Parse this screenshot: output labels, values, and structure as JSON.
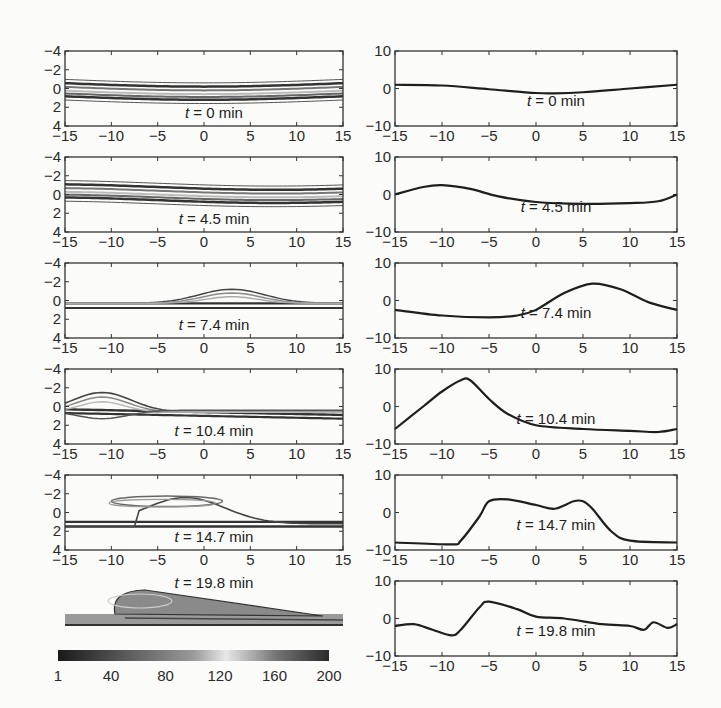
{
  "chart_data": [
    {
      "type": "heatmap",
      "column": "left",
      "description": "Contour plots of concentration field at successive times",
      "x_ticks": [
        -15,
        -10,
        -5,
        0,
        5,
        10,
        15
      ],
      "y_ticks": [
        -4,
        -2,
        0,
        2,
        4
      ],
      "xlim": [
        -15,
        15
      ],
      "ylim": [
        4,
        -4
      ],
      "panels": [
        {
          "label": "t = 0 min",
          "time": "0 min"
        },
        {
          "label": "t = 4.5 min",
          "time": "4.5 min"
        },
        {
          "label": "t = 7.4 min",
          "time": "7.4 min"
        },
        {
          "label": "t = 10.4 min",
          "time": "10.4 min"
        },
        {
          "label": "t = 14.7 min",
          "time": "14.7 min"
        },
        {
          "label": "t = 19.8 min",
          "time": "19.8 min"
        }
      ],
      "colorbar": {
        "ticks": [
          1,
          40,
          80,
          120,
          160,
          200
        ],
        "range": [
          1,
          200
        ]
      }
    },
    {
      "type": "line",
      "column": "right",
      "x_ticks": [
        -15,
        -10,
        -5,
        0,
        5,
        10,
        15
      ],
      "y_ticks": [
        10,
        0,
        -10
      ],
      "xlim": [
        -15,
        15
      ],
      "ylim": [
        -10,
        10
      ],
      "grid": false,
      "series": [
        {
          "name": "t = 0 min",
          "x": [
            -15,
            -10,
            -5,
            0,
            2,
            5,
            10,
            15
          ],
          "y": [
            1,
            0.8,
            -0.2,
            -1.2,
            -1.3,
            -1,
            0,
            1
          ]
        },
        {
          "name": "t = 4.5 min",
          "x": [
            -15,
            -12,
            -10,
            -7,
            -4,
            0,
            5,
            10,
            13,
            15
          ],
          "y": [
            0,
            2,
            2.5,
            1.5,
            -0.5,
            -2,
            -2.5,
            -2.3,
            -1.8,
            0
          ]
        },
        {
          "name": "t = 7.4 min",
          "x": [
            -15,
            -10,
            -5,
            -2,
            0,
            3,
            6,
            9,
            12,
            15
          ],
          "y": [
            -2.5,
            -4,
            -4.5,
            -4,
            -2.5,
            2,
            4.5,
            3,
            -0.5,
            -2.5
          ]
        },
        {
          "name": "t = 10.4 min",
          "x": [
            -15,
            -12,
            -10,
            -8,
            -7,
            -5,
            -3,
            0,
            5,
            10,
            13,
            15
          ],
          "y": [
            -6,
            0,
            4,
            7,
            7,
            2,
            -2,
            -5,
            -6,
            -6.5,
            -6.8,
            -6
          ]
        },
        {
          "name": "t = 14.7 min",
          "x": [
            -15,
            -9,
            -8,
            -6,
            -5,
            -3,
            0,
            2,
            4,
            5,
            6,
            8,
            10,
            15
          ],
          "y": [
            -8,
            -8.5,
            -7.5,
            -1,
            3,
            3.5,
            2,
            1,
            3,
            3,
            1,
            -5,
            -7.5,
            -8
          ]
        },
        {
          "name": "t = 19.8 min",
          "x": [
            -15,
            -13,
            -11,
            -9,
            -8,
            -6,
            -5,
            -2,
            0,
            3,
            7,
            10,
            11.5,
            12.5,
            14,
            15
          ],
          "y": [
            -2,
            -1.5,
            -3,
            -4.5,
            -3,
            3,
            4.5,
            2.5,
            0.5,
            0,
            -1.5,
            -2,
            -3,
            -1,
            -2.5,
            -1.5
          ]
        }
      ]
    }
  ]
}
